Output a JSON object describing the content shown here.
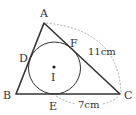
{
  "figure": {
    "type": "triangle-with-incircle",
    "colors": {
      "stroke": "#333333",
      "dashed": "#999999",
      "background": "#ffffff"
    },
    "points": {
      "A": {
        "label": "A",
        "x": 44,
        "y": 23
      },
      "B": {
        "label": "B",
        "x": 16,
        "y": 94
      },
      "C": {
        "label": "C",
        "x": 120,
        "y": 94
      },
      "D": {
        "label": "D",
        "x": 31,
        "y": 59
      },
      "E": {
        "label": "E",
        "x": 54,
        "y": 94
      },
      "F": {
        "label": "F",
        "x": 70,
        "y": 50
      },
      "I": {
        "label": "I",
        "x": 54,
        "y": 67
      }
    },
    "incircle": {
      "center": "I",
      "radius": 26
    },
    "measurements": {
      "AC": {
        "label": "11cm",
        "from": "A",
        "to": "C"
      },
      "EC": {
        "label": "7cm",
        "from": "E",
        "to": "C"
      }
    }
  }
}
